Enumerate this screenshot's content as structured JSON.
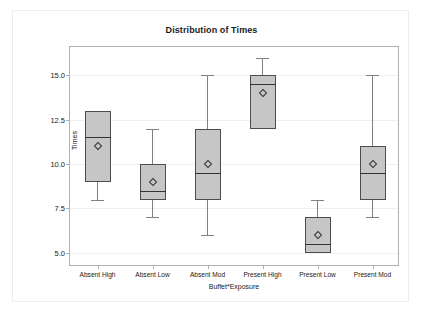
{
  "chart_data": {
    "type": "box",
    "title": "Distribution of Times",
    "xlabel": "Buffet*Exposure",
    "ylabel": "Times",
    "ylim": [
      4.2,
      16.6
    ],
    "yticks": [
      5.0,
      7.5,
      10.0,
      12.5,
      15.0
    ],
    "ytick_labels": [
      "5.0",
      "7.5",
      "10.0",
      "12.5",
      "15.0"
    ],
    "grid": true,
    "legend": "none",
    "categories": [
      "Absent High",
      "Absent Low",
      "Absent Mod",
      "Present High",
      "Present Low",
      "Present Mod"
    ],
    "boxes": [
      {
        "category": "Absent High",
        "min": 8.0,
        "q1": 9.0,
        "median": 11.5,
        "q3": 13.0,
        "max": 13.0,
        "mean": 11.0
      },
      {
        "category": "Absent Low",
        "min": 7.0,
        "q1": 8.0,
        "median": 8.5,
        "q3": 10.0,
        "max": 12.0,
        "mean": 9.0
      },
      {
        "category": "Absent Mod",
        "min": 6.0,
        "q1": 8.0,
        "median": 9.5,
        "q3": 12.0,
        "max": 15.0,
        "mean": 10.0
      },
      {
        "category": "Present High",
        "min": 12.0,
        "q1": 12.0,
        "median": 14.5,
        "q3": 15.0,
        "max": 16.0,
        "mean": 14.0
      },
      {
        "category": "Present Low",
        "min": 5.0,
        "q1": 5.0,
        "median": 5.5,
        "q3": 7.0,
        "max": 8.0,
        "mean": 6.0
      },
      {
        "category": "Present Mod",
        "min": 7.0,
        "q1": 8.0,
        "median": 9.5,
        "q3": 11.0,
        "max": 15.0,
        "mean": 10.0
      }
    ],
    "colors": {
      "box_fill": "#c6c6c6",
      "box_border": "#4d4d4d",
      "whisker": "#808080",
      "median": "#333333",
      "gridline": "#f0f0f0",
      "frame": "#b0b0b0",
      "text": "#1a1a1a",
      "background": "#ffffff"
    }
  }
}
